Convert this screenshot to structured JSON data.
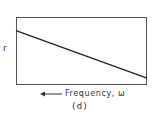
{
  "chart_data": {
    "type": "line",
    "title": "",
    "subtitle": "(d)",
    "xlabel": "Frequency, ω",
    "xlabel_arrow": "left",
    "ylabel": "r",
    "grid": false,
    "legend": null,
    "series": [
      {
        "name": "r",
        "x": [
          0,
          1
        ],
        "values": [
          0.8,
          0.1
        ]
      }
    ],
    "xlim": [
      0,
      1
    ],
    "ylim": [
      0,
      1
    ],
    "line_color": "#222222"
  },
  "labels": {
    "ylabel": "r",
    "xlabel": "Frequency, ω",
    "panel": "(d)"
  }
}
